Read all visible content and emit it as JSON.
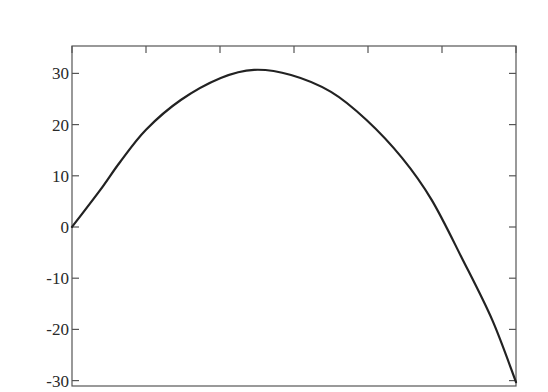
{
  "chart_data": {
    "type": "line",
    "title": "",
    "xlabel": "",
    "ylabel": "",
    "x_ticks_count": 7,
    "x_tick_labels": [],
    "y_ticks": [
      30,
      20,
      10,
      0,
      -10,
      -20,
      -30
    ],
    "y_tick_labels": [
      "30",
      "20",
      "10",
      "0",
      "-10",
      "-20",
      "-30"
    ],
    "ylim": [
      -30,
      35.5
    ],
    "xlim": [
      0,
      6
    ],
    "grid": false,
    "legend": null,
    "series": [
      {
        "name": "curve",
        "color": "#222222",
        "x": [
          0,
          0.38,
          0.65,
          1.0,
          1.47,
          2.01,
          2.46,
          2.96,
          3.5,
          3.98,
          4.46,
          4.86,
          5.27,
          5.68,
          6.0
        ],
        "y": [
          0,
          7.2,
          12.7,
          19.0,
          24.8,
          29.1,
          30.7,
          29.7,
          26.4,
          20.9,
          13.5,
          5.3,
          -6.1,
          -18.2,
          -30.3
        ]
      }
    ]
  },
  "axes": {
    "y_labels": [
      "30",
      "20",
      "10",
      "0",
      "-10",
      "-20",
      "-30"
    ]
  }
}
